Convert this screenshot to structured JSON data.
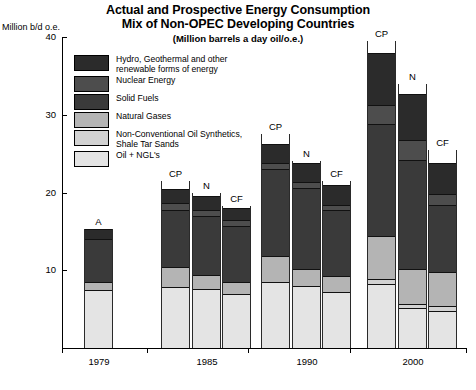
{
  "chart_data": {
    "type": "bar",
    "stacked": true,
    "title": "Actual and Prospective Energy Consumption Mix of Non-OPEC Developing Countries",
    "title_lines": [
      "Actual and Prospective Energy Consumption",
      "Mix of Non-OPEC Developing Countries"
    ],
    "subtitle": "(Million barrels a day oil/o.e.)",
    "ylabel": "Million b/d o.e.",
    "xlabel": "",
    "ylim": [
      0,
      40
    ],
    "yticks": [
      10,
      20,
      30,
      40
    ],
    "ytick_labels": [
      "10",
      "20",
      "30",
      "40"
    ],
    "grid": false,
    "categories": [
      "1979",
      "1985",
      "1990",
      "2000"
    ],
    "scenario_labels": [
      "A",
      "CP",
      "N",
      "CF"
    ],
    "legend_position": "inside-upper-left",
    "series": [
      {
        "name": "Hydro, Geothermal and other renewable forms of energy",
        "short": "Hydro/Geothermal/Renewables",
        "color": "#2b2b2b"
      },
      {
        "name": "Nuclear Energy",
        "short": "Nuclear Energy",
        "color": "#4d4d4d"
      },
      {
        "name": "Solid Fuels",
        "short": "Solid Fuels",
        "color": "#3a3a3a"
      },
      {
        "name": "Natural Gases",
        "short": "Natural Gases",
        "color": "#b4b4b4"
      },
      {
        "name": "Non-Conventional Oil Synthetics, Shale Tar Sands",
        "short": "Non-Conventional Oil Synthetics",
        "color": "#d2d2d2"
      },
      {
        "name": "Oil + NGL's",
        "short": "Oil + NGL's",
        "color": "#e4e4e4"
      }
    ],
    "legend_entries": [
      {
        "label_lines": [
          "Hydro, Geothermal and other",
          "renewable forms of energy"
        ],
        "color": "#2b2b2b"
      },
      {
        "label_lines": [
          "Nuclear Energy"
        ],
        "color": "#4d4d4d"
      },
      {
        "label_lines": [
          "Solid Fuels"
        ],
        "color": "#3a3a3a"
      },
      {
        "label_lines": [
          "Natural Gases"
        ],
        "color": "#b4b4b4"
      },
      {
        "label_lines": [
          "Non-Conventional Oil Synthetics,",
          "Shale Tar Sands"
        ],
        "color": "#d2d2d2"
      },
      {
        "label_lines": [
          "Oil + NGL's"
        ],
        "color": "#e4e4e4"
      }
    ],
    "bars": [
      {
        "group": "1979",
        "scenario": "A",
        "total": 15.3,
        "values": {
          "oil_ngl": 7.5,
          "non_conventional": 0.0,
          "natural_gases": 1.0,
          "solid_fuels": 5.5,
          "nuclear": 0.0,
          "hydro_renewables": 1.3
        }
      },
      {
        "group": "1985",
        "scenario": "CP",
        "total": 21.5,
        "values": {
          "oil_ngl": 7.8,
          "non_conventional": 0.0,
          "natural_gases": 2.6,
          "solid_fuels": 7.4,
          "nuclear": 0.8,
          "hydro_renewables": 1.8
        }
      },
      {
        "group": "1985",
        "scenario": "N",
        "total": 20.0,
        "values": {
          "oil_ngl": 7.6,
          "non_conventional": 0.0,
          "natural_gases": 1.8,
          "solid_fuels": 7.6,
          "nuclear": 0.8,
          "hydro_renewables": 1.7
        }
      },
      {
        "group": "1985",
        "scenario": "CF",
        "total": 18.3,
        "values": {
          "oil_ngl": 7.0,
          "non_conventional": 0.0,
          "natural_gases": 1.5,
          "solid_fuels": 7.2,
          "nuclear": 0.7,
          "hydro_renewables": 1.6
        }
      },
      {
        "group": "1990",
        "scenario": "CP",
        "total": 27.5,
        "values": {
          "oil_ngl": 8.5,
          "non_conventional": 0.0,
          "natural_gases": 3.3,
          "solid_fuels": 11.2,
          "nuclear": 0.8,
          "hydro_renewables": 2.5
        }
      },
      {
        "group": "1990",
        "scenario": "N",
        "total": 24.0,
        "values": {
          "oil_ngl": 8.0,
          "non_conventional": 0.0,
          "natural_gases": 2.2,
          "solid_fuels": 10.4,
          "nuclear": 0.8,
          "hydro_renewables": 2.4
        }
      },
      {
        "group": "1990",
        "scenario": "CF",
        "total": 21.5,
        "values": {
          "oil_ngl": 7.2,
          "non_conventional": 0.0,
          "natural_gases": 2.1,
          "solid_fuels": 8.4,
          "nuclear": 0.7,
          "hydro_renewables": 2.6
        }
      },
      {
        "group": "2000",
        "scenario": "CP",
        "total": 39.5,
        "values": {
          "oil_ngl": 8.2,
          "non_conventional": 0.7,
          "natural_gases": 5.5,
          "solid_fuels": 14.4,
          "nuclear": 2.5,
          "hydro_renewables": 6.7
        }
      },
      {
        "group": "2000",
        "scenario": "N",
        "total": 34.0,
        "values": {
          "oil_ngl": 5.1,
          "non_conventional": 0.6,
          "natural_gases": 4.4,
          "solid_fuels": 14.1,
          "nuclear": 2.5,
          "hydro_renewables": 6.0
        }
      },
      {
        "group": "2000",
        "scenario": "CF",
        "total": 25.5,
        "values": {
          "oil_ngl": 4.8,
          "non_conventional": 0.6,
          "natural_gases": 4.4,
          "solid_fuels": 8.6,
          "nuclear": 1.4,
          "hydro_renewables": 4.0
        }
      }
    ]
  }
}
